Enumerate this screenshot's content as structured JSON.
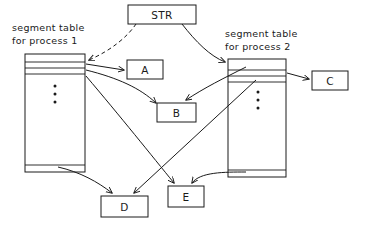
{
  "diagram": {
    "stroke_color": "#1a1a1a",
    "background_color": "#ffffff",
    "captions": [
      {
        "name": "left-table-caption",
        "line1": "segment table",
        "line2": "for process 1"
      },
      {
        "name": "right-table-caption",
        "line1": "segment table",
        "line2": "for process 2"
      }
    ],
    "register": {
      "label": "STR",
      "x": 128,
      "y": 5,
      "w": 68,
      "h": 19
    },
    "segment_boxes": [
      {
        "id": "A",
        "label": "A",
        "x": 127,
        "y": 60,
        "w": 36,
        "h": 19
      },
      {
        "id": "B",
        "label": "B",
        "x": 157,
        "y": 103,
        "w": 39,
        "h": 19
      },
      {
        "id": "C",
        "label": "C",
        "x": 312,
        "y": 71,
        "w": 36,
        "h": 19
      },
      {
        "id": "D",
        "label": "D",
        "x": 101,
        "y": 196,
        "w": 47,
        "h": 21
      },
      {
        "id": "E",
        "label": "E",
        "x": 168,
        "y": 186,
        "w": 36,
        "h": 21
      }
    ],
    "tables": [
      {
        "id": "left-segment-table",
        "process": "1",
        "x": 25,
        "y": 54,
        "w": 60,
        "h": 118,
        "row_dividers_y": [
          62,
          68,
          74
        ],
        "bottom_divider_y": 165,
        "ellipsis_dots": 3
      },
      {
        "id": "right-segment-table",
        "process": "2",
        "x": 228,
        "y": 59,
        "w": 58,
        "h": 118,
        "row_dividers_y": [
          70,
          76,
          82
        ],
        "bottom_divider_y": 170,
        "ellipsis_dots": 3
      }
    ],
    "connections": [
      {
        "name": "str-to-left-table",
        "style": "dashed",
        "from": "STR",
        "to": "left-segment-table"
      },
      {
        "name": "str-to-right-table",
        "style": "solid",
        "from": "STR",
        "to": "right-segment-table"
      },
      {
        "name": "left-table-to-a",
        "style": "solid",
        "from": "left-segment-table",
        "to": "A"
      },
      {
        "name": "left-table-to-b",
        "style": "solid",
        "from": "left-segment-table",
        "to": "B"
      },
      {
        "name": "left-table-to-e",
        "style": "solid",
        "from": "left-segment-table",
        "to": "E"
      },
      {
        "name": "left-table-to-d",
        "style": "solid",
        "from": "left-segment-table",
        "to": "D"
      },
      {
        "name": "right-table-to-b",
        "style": "solid",
        "from": "right-segment-table",
        "to": "B"
      },
      {
        "name": "right-table-to-c",
        "style": "solid",
        "from": "right-segment-table",
        "to": "C"
      },
      {
        "name": "right-table-to-d",
        "style": "solid",
        "from": "right-segment-table",
        "to": "D"
      },
      {
        "name": "right-table-to-e",
        "style": "solid",
        "from": "right-segment-table",
        "to": "E"
      }
    ]
  }
}
